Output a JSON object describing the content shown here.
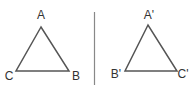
{
  "diagram": {
    "left_triangle": {
      "vertices": {
        "top": "A",
        "bottom_left": "C",
        "bottom_right": "B"
      }
    },
    "right_triangle": {
      "vertices": {
        "top": "A'",
        "bottom_left": "B'",
        "bottom_right": "C'"
      }
    },
    "colors": {
      "stroke": "#555555",
      "divider": "#888888",
      "label": "#333333"
    }
  }
}
